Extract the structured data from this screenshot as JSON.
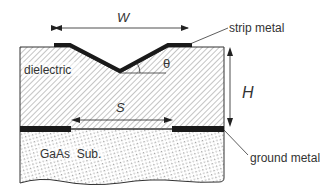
{
  "diagram": {
    "title": "",
    "labels": {
      "width": "W",
      "height": "H",
      "spacing": "S",
      "angle": "θ",
      "dielectric": "dielectric",
      "substrate": "GaAs  Sub.",
      "strip_metal": "strip metal",
      "ground_metal": "ground metal"
    },
    "colors": {
      "metal": "#1a1a1a",
      "line": "#333333",
      "hatch": "#8a8a8a",
      "dots": "#9a9a9a",
      "background": "#ffffff"
    }
  }
}
